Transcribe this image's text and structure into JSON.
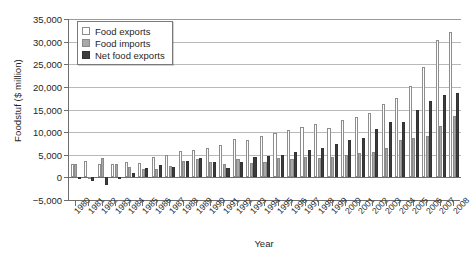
{
  "chart_data": {
    "type": "bar",
    "title": "",
    "xlabel": "Year",
    "ylabel": "Foodstuf ($ million)",
    "ylim": [
      -5000,
      35000
    ],
    "ytick_step": 5000,
    "yticks": [
      -5000,
      0,
      5000,
      10000,
      15000,
      20000,
      25000,
      30000,
      35000
    ],
    "ytick_labels": [
      "−5,000",
      "0",
      "5,000",
      "10,000",
      "15,000",
      "20,000",
      "25,000",
      "30,000",
      "35,000"
    ],
    "grid": true,
    "legend_position": "top-left",
    "categories": [
      "1980",
      "1981",
      "1982",
      "1983",
      "1984",
      "1985",
      "1986",
      "1987",
      "1988",
      "1989",
      "1990",
      "1991",
      "1992",
      "1993",
      "1994",
      "1995",
      "1996",
      "1997",
      "1998",
      "1999",
      "2000",
      "2001",
      "2002",
      "2003",
      "2004",
      "2005",
      "2006",
      "2007",
      "2008"
    ],
    "series": [
      {
        "name": "Food exports",
        "color": "#ffffff",
        "values": [
          3000,
          3600,
          2850,
          2950,
          3400,
          3100,
          4500,
          4900,
          5800,
          6050,
          6600,
          7200,
          8400,
          8300,
          9200,
          9900,
          10400,
          11100,
          11800,
          11000,
          12600,
          13400,
          14300,
          16200,
          17600,
          20200,
          24400,
          30400,
          32200
        ]
      },
      {
        "name": "Food imports",
        "color": "#a8a8a8",
        "values": [
          2900,
          100,
          4300,
          2950,
          2400,
          1900,
          1950,
          2500,
          3550,
          4100,
          3300,
          3000,
          4100,
          3150,
          3450,
          4300,
          4000,
          4500,
          4300,
          4600,
          5000,
          5300,
          5500,
          6500,
          8200,
          8600,
          9100,
          11300,
          13600
        ]
      },
      {
        "name": "Net food exports",
        "color": "#3c3c3c",
        "values": [
          100,
          -800,
          -1600,
          -200,
          1000,
          2000,
          2800,
          2400,
          3600,
          4200,
          3300,
          2050,
          3300,
          4500,
          4800,
          5000,
          5600,
          6100,
          6600,
          7300,
          8200,
          8700,
          10600,
          12200,
          12300,
          14800,
          16800,
          18100,
          18700
        ]
      }
    ]
  },
  "legend": {
    "items": [
      {
        "label": "Food exports",
        "class": "exp"
      },
      {
        "label": "Food imports",
        "class": "imp"
      },
      {
        "label": "Net food exports",
        "class": "net"
      }
    ]
  }
}
